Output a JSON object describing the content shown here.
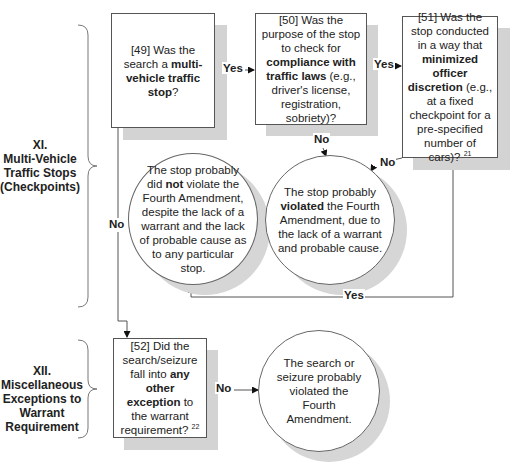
{
  "sections": [
    {
      "id": "XI",
      "lines": [
        "XI.",
        "Multi-Vehicle",
        "Traffic Stops",
        "(Checkpoints)"
      ]
    },
    {
      "id": "XII",
      "lines": [
        "XII.",
        "Miscellaneous",
        "Exceptions to",
        "Warrant",
        "Requirement"
      ]
    }
  ],
  "nodes": {
    "q49": {
      "pre": "[49] Was the search a ",
      "bold": "multi-vehicle traffic stop",
      "post": "?"
    },
    "q50": {
      "pre": "[50] Was the purpose of the stop to check for ",
      "bold": "compliance with traffic laws",
      "post": " (e.g., driver's license, registration, sobriety)?"
    },
    "q51": {
      "pre": "[51] Was the stop conducted in a way that ",
      "bold": "minimized officer discretion",
      "post": " (e.g., at a fixed checkpoint for a pre-specified number of cars)?",
      "footnote": "21"
    },
    "q52": {
      "pre": "[52] Did the search/seizure fall into ",
      "bold": "any other exception",
      "post": " to the warrant requirement?",
      "footnote": "22"
    },
    "c_not_violate": {
      "pre": "The stop probably did ",
      "bold": "not",
      "post": " violate the Fourth Amendment, despite the lack of a warrant and the lack of probable cause as to any particular stop."
    },
    "c_violated": {
      "pre": "The stop probably ",
      "bold": "violated",
      "post": " the Fourth Amendment, due to the lack of a warrant and probable cause."
    },
    "c_search_violated": {
      "pre": "The search or seizure probably violated the Fourth Amendment.",
      "bold": "",
      "post": ""
    }
  },
  "edges": {
    "e49_50": "Yes",
    "e50_51": "Yes",
    "e50_violated": "No",
    "e51_violated": "No",
    "e51_not_violate": "Yes",
    "e49_52": "No",
    "e52_search": "No"
  }
}
